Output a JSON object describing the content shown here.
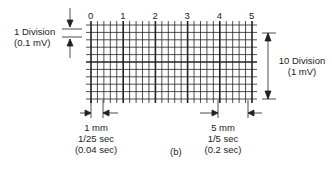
{
  "diagram": {
    "caption": "(b)",
    "column_numbers": [
      "0",
      "1",
      "2",
      "3",
      "4",
      "5"
    ],
    "left_label": {
      "line1": "1 Division",
      "line2": "(0.1 mV)"
    },
    "right_label": {
      "line1": "10 Division",
      "line2": "(1 mV)"
    },
    "bottom_left_label": {
      "line1": "1 mm",
      "line2": "1/25 sec",
      "line3": "(0.04 sec)"
    },
    "bottom_right_label": {
      "line1": "5 mm",
      "line2": "1/5 sec",
      "line3": "(0.2 sec)"
    },
    "grid": {
      "major_columns": 5,
      "minor_per_major": 5,
      "rows": 10,
      "line_color": "#222222"
    }
  }
}
